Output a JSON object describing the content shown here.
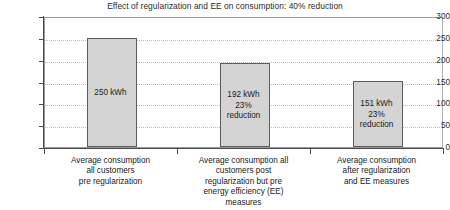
{
  "chart_data": {
    "type": "bar",
    "title": "Effect of regularization and EE on consumption: 40% reduction",
    "xlabel": "",
    "ylabel": "",
    "ylim": [
      0,
      300
    ],
    "yticks": [
      "0",
      "50",
      "100",
      "150",
      "200",
      "250",
      "300"
    ],
    "grid": true,
    "legend": "none",
    "categories": [
      "Average consumption\nall customers\npre regularization",
      "Average consumption all\ncustomers post\nregularization but pre\nenergy efficiency (EE)\nmeasures",
      "Average consumption\nafter regularization\nand EE measures"
    ],
    "values": [
      250,
      192,
      151
    ],
    "bar_labels": [
      "250 kWh",
      "192 kWh\n23%\nreduction",
      "151 kWh\n23%\nreduction"
    ],
    "colors": {
      "bar_fill": "#d4d4d4",
      "bar_border": "#5c5c5c",
      "gridline": "#bdbdbd",
      "axis": "#4a4a4a",
      "text": "#1a1a1a"
    }
  }
}
